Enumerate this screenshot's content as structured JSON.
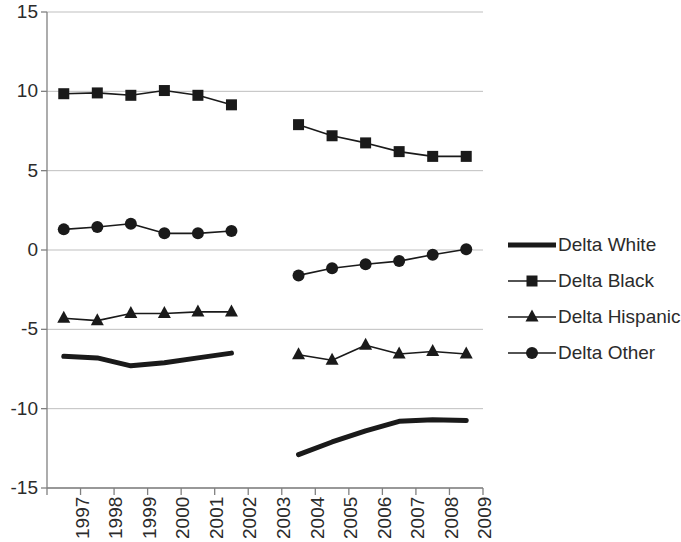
{
  "chart_data": {
    "type": "line",
    "title": "",
    "xlabel": "",
    "ylabel": "",
    "ylim": [
      -15,
      15
    ],
    "ytick_values": [
      15,
      10,
      5,
      0,
      -5,
      -10,
      -15
    ],
    "ytick_labels": [
      "15",
      "10",
      "5",
      "0",
      "-5",
      "-10",
      "-15"
    ],
    "grid": true,
    "grid_axis": "y",
    "legend_position": "right",
    "categories": [
      "1997",
      "1998",
      "1999",
      "2000",
      "2001",
      "2002",
      "2003",
      "2004",
      "2005",
      "2006",
      "2007",
      "2008",
      "2009"
    ],
    "break_category": "2003",
    "series": [
      {
        "name": "Delta White",
        "marker": "none",
        "line_width": 5,
        "color": "#1a1a1a",
        "values": [
          -6.7,
          -6.8,
          -7.3,
          -7.1,
          -6.8,
          -6.5,
          null,
          -12.9,
          -12.1,
          -11.4,
          -10.8,
          -10.7,
          -10.75
        ]
      },
      {
        "name": "Delta Black",
        "marker": "square",
        "line_width": 1.6,
        "color": "#1a1a1a",
        "values": [
          9.85,
          9.9,
          9.75,
          10.05,
          9.75,
          9.15,
          null,
          7.9,
          7.2,
          6.75,
          6.2,
          5.9,
          5.9
        ]
      },
      {
        "name": "Delta Hispanic",
        "marker": "triangle",
        "line_width": 1.6,
        "color": "#1a1a1a",
        "values": [
          -4.3,
          -4.45,
          -4.0,
          -4.0,
          -3.9,
          -3.9,
          null,
          -6.6,
          -6.95,
          -6.0,
          -6.55,
          -6.4,
          -6.55
        ]
      },
      {
        "name": "Delta Other",
        "marker": "circle",
        "line_width": 1.6,
        "color": "#1a1a1a",
        "values": [
          1.3,
          1.45,
          1.65,
          1.05,
          1.05,
          1.2,
          null,
          -1.6,
          -1.15,
          -0.9,
          -0.7,
          -0.3,
          0.05
        ]
      }
    ],
    "legend_entries": [
      "Delta White",
      "Delta Black",
      "Delta Hispanic",
      "Delta Other"
    ]
  },
  "axis": {
    "color": "#808080",
    "grid_color": "#bfbfbf"
  }
}
